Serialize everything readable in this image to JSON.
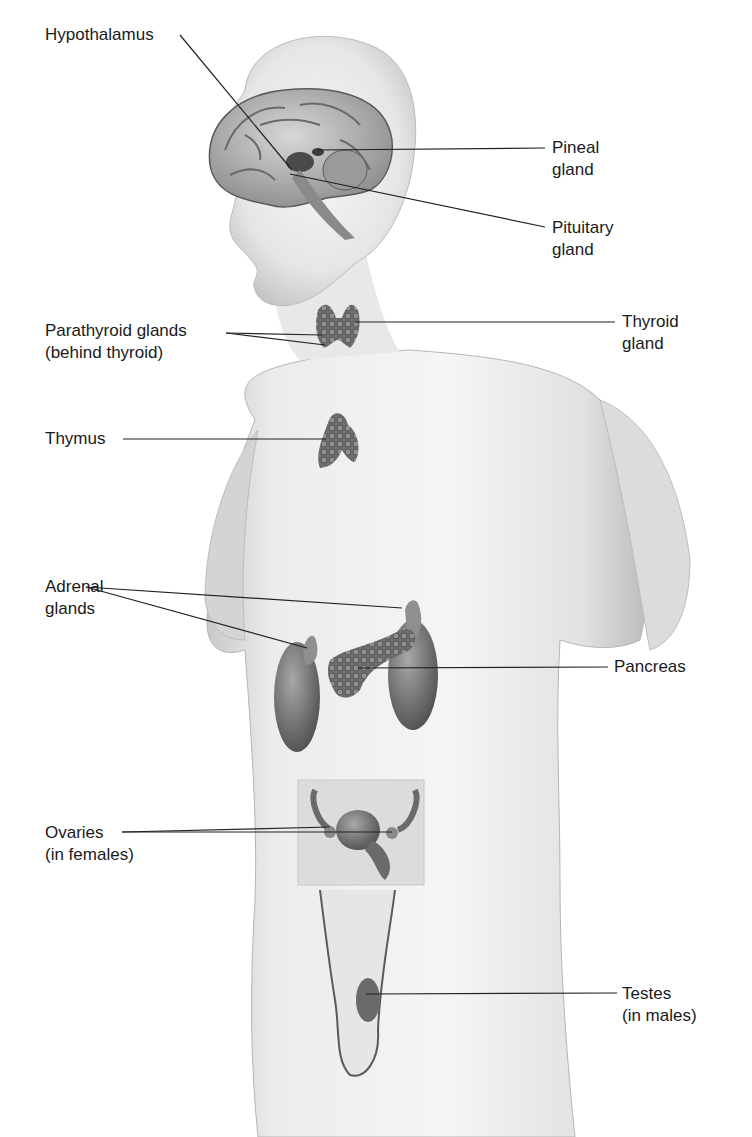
{
  "figure": {
    "labels": {
      "hypothalamus": {
        "line1": "Hypothalamus"
      },
      "pineal": {
        "line1": "Pineal",
        "line2": "gland"
      },
      "pituitary": {
        "line1": "Pituitary",
        "line2": "gland"
      },
      "parathyroid": {
        "line1": "Parathyroid glands",
        "line2": "(behind thyroid)"
      },
      "thyroid": {
        "line1": "Thyroid",
        "line2": "gland"
      },
      "thymus": {
        "line1": "Thymus"
      },
      "adrenal": {
        "line1": "Adrenal",
        "line2": "glands"
      },
      "pancreas": {
        "line1": "Pancreas"
      },
      "ovaries": {
        "line1": "Ovaries",
        "line2": "(in females)"
      },
      "testes": {
        "line1": "Testes",
        "line2": "(in males)"
      }
    },
    "colors": {
      "skin": "#e9e9e9",
      "skin_shadow": "#bdbdbd",
      "organ": "#7a7a7a",
      "organ_dark": "#4a4a4a",
      "leader_line": "#222222",
      "text": "#1a1a1a"
    }
  }
}
